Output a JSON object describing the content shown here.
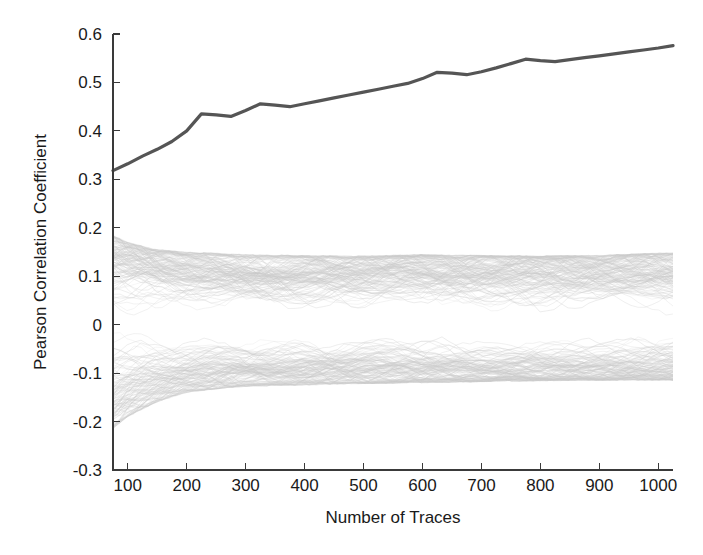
{
  "chart_data": {
    "type": "line",
    "title": "",
    "xlabel": "Number of Traces",
    "ylabel": "Pearson Correlation Coefficient",
    "xlim": [
      75,
      1025
    ],
    "ylim": [
      -0.3,
      0.6
    ],
    "xticks": [
      100,
      200,
      300,
      400,
      500,
      600,
      700,
      800,
      900,
      1000
    ],
    "xtick_labels": [
      "100",
      "200",
      "300",
      "400",
      "500",
      "600",
      "700",
      "800",
      "900",
      "1000"
    ],
    "yticks": [
      -0.3,
      -0.2,
      -0.1,
      0,
      0.1,
      0.2,
      0.3,
      0.4,
      0.5,
      0.6
    ],
    "ytick_labels": [
      "-0.3",
      "-0.2",
      "-0.1",
      "0",
      "0.1",
      "0.2",
      "0.3",
      "0.4",
      "0.5",
      "0.6"
    ],
    "grid": false,
    "legend": "none",
    "series": [
      {
        "name": "correct-key-correlation",
        "color": "#555555",
        "linewidth": 3.2,
        "x": [
          75,
          100,
          125,
          150,
          175,
          200,
          225,
          250,
          275,
          300,
          325,
          350,
          375,
          400,
          425,
          450,
          475,
          500,
          525,
          550,
          575,
          600,
          625,
          650,
          675,
          700,
          725,
          750,
          775,
          800,
          825,
          850,
          875,
          900,
          925,
          950,
          975,
          1000,
          1025
        ],
        "values": [
          0.318,
          0.332,
          0.348,
          0.362,
          0.378,
          0.4,
          0.435,
          0.433,
          0.43,
          0.442,
          0.456,
          0.453,
          0.45,
          0.456,
          0.462,
          0.468,
          0.474,
          0.48,
          0.486,
          0.492,
          0.498,
          0.508,
          0.521,
          0.519,
          0.516,
          0.522,
          0.53,
          0.539,
          0.548,
          0.545,
          0.543,
          0.547,
          0.551,
          0.555,
          0.559,
          0.563,
          0.567,
          0.571,
          0.576
        ]
      },
      {
        "name": "wrong-key-correlations",
        "color": "#c9c9c9",
        "linewidth": 0.5,
        "count": 255,
        "description": "bundle of wrong key-guess correlation traces converging toward zero",
        "envelope_x": [
          75,
          100,
          150,
          200,
          250,
          300,
          400,
          500,
          600,
          700,
          800,
          900,
          1000,
          1025
        ],
        "envelope_upper": [
          0.185,
          0.17,
          0.155,
          0.15,
          0.148,
          0.145,
          0.143,
          0.142,
          0.145,
          0.143,
          0.142,
          0.144,
          0.148,
          0.148
        ],
        "envelope_lower": [
          -0.215,
          -0.19,
          -0.16,
          -0.14,
          -0.133,
          -0.128,
          -0.125,
          -0.122,
          -0.12,
          -0.118,
          -0.116,
          -0.115,
          -0.115,
          -0.115
        ],
        "core_upper": [
          0.125,
          0.12,
          0.115,
          0.112,
          0.11,
          0.108,
          0.106,
          0.105,
          0.105,
          0.104,
          0.103,
          0.103,
          0.102,
          0.102
        ],
        "core_lower": [
          -0.12,
          -0.115,
          -0.11,
          -0.106,
          -0.104,
          -0.102,
          -0.1,
          -0.099,
          -0.098,
          -0.097,
          -0.096,
          -0.096,
          -0.095,
          -0.095
        ]
      }
    ]
  },
  "figure": {
    "background_color": "#ffffff",
    "axis_color": "#3a3a3a",
    "text_color": "#1a1a1a"
  }
}
